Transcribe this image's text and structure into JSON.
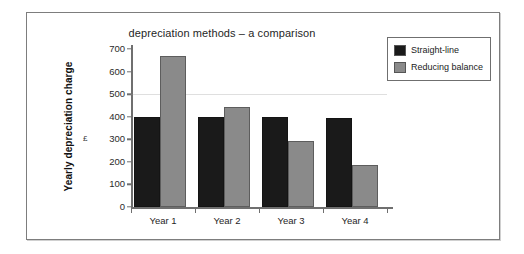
{
  "chart_data": {
    "type": "bar",
    "title": "depreciation methods – a comparison",
    "xlabel": "",
    "ylabel": "Yearly depreciation charge",
    "unit_label": "£",
    "categories": [
      "Year  1",
      "Year  2",
      "Year  3",
      "Year  4"
    ],
    "series": [
      {
        "name": "Straight-line",
        "color": "#1a1a1a",
        "values": [
          400,
          400,
          397,
          396
        ]
      },
      {
        "name": "Reducing balance",
        "color": "#8a8a8a",
        "values": [
          667,
          441,
          293,
          185
        ]
      }
    ],
    "ylim": [
      0,
      700
    ],
    "ytick_values": [
      0,
      100,
      200,
      300,
      400,
      500,
      600,
      700
    ],
    "ytick_labels": [
      "0",
      "100",
      "200",
      "300",
      "400",
      "500",
      "600",
      "700"
    ],
    "grid": "single faint horizontal line at 500",
    "gridline_values": [
      500
    ],
    "legend_position": "top-right outside plot"
  },
  "legend": {
    "items": [
      {
        "label": "Straight-line",
        "color": "#1a1a1a"
      },
      {
        "label": "Reducing balance",
        "color": "#8a8a8a"
      }
    ]
  },
  "colors": {
    "series_straight_line": "#1a1a1a",
    "series_reducing_balance": "#8a8a8a",
    "frame_border": "#7d7d7d",
    "axis": "#6f6f6f",
    "background": "#ffffff"
  }
}
